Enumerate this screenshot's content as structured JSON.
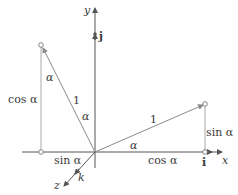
{
  "diagram": {
    "colors": {
      "axis": "#555555",
      "vector": "#8a8a8a",
      "guide": "#aaaaaa",
      "text": "#3a3a3a"
    },
    "axes": {
      "x_label": "x",
      "y_label": "y",
      "z_label": "z"
    },
    "unit_vectors": {
      "i": "i",
      "j": "j",
      "k": "k"
    },
    "right_triangle": {
      "hypotenuse_label": "1",
      "angle_label": "α",
      "adjacent_label": "cos α",
      "opposite_label": "sin α"
    },
    "left_triangle": {
      "hypotenuse_label": "1",
      "angle_label_top": "α",
      "angle_label_origin": "α",
      "vertical_label": "cos α",
      "horizontal_label": "sin α"
    }
  }
}
